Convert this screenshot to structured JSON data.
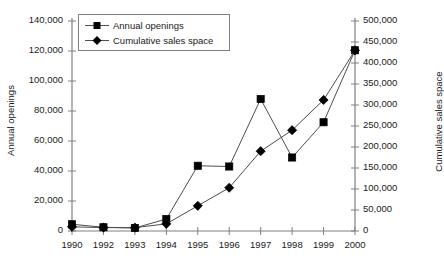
{
  "chart_data": {
    "type": "line",
    "title": "",
    "xlabel": "",
    "grid": false,
    "legend_position": "top-left",
    "categories": [
      "1990",
      "1992",
      "1993",
      "1994",
      "1995",
      "1996",
      "1997",
      "1998",
      "1999",
      "2000"
    ],
    "axes": {
      "left": {
        "label": "Annual openings",
        "ylim": [
          0,
          140000
        ],
        "tick_step": 20000,
        "ticks": [
          "0",
          "20,000",
          "40,000",
          "60,000",
          "80,000",
          "100,000",
          "120,000",
          "140,000"
        ],
        "tick_values": [
          0,
          20000,
          40000,
          60000,
          80000,
          100000,
          120000,
          140000
        ]
      },
      "right": {
        "label": "Cumulative sales space",
        "ylim": [
          0,
          500000
        ],
        "tick_step": 50000,
        "ticks": [
          "0",
          "50,000",
          "100,000",
          "150,000",
          "200,000",
          "250,000",
          "300,000",
          "350,000",
          "400,000",
          "450,000",
          "500,000"
        ],
        "tick_values": [
          0,
          50000,
          100000,
          150000,
          200000,
          250000,
          300000,
          350000,
          400000,
          450000,
          500000
        ]
      }
    },
    "series": [
      {
        "name": "Annual openings",
        "axis": "left",
        "marker": "square",
        "color": "#000000",
        "values": [
          4500,
          2500,
          2000,
          8000,
          43500,
          43000,
          88000,
          49000,
          72500,
          120500
        ]
      },
      {
        "name": "Cumulative sales space",
        "axis": "right",
        "marker": "diamond",
        "color": "#000000",
        "values": [
          10000,
          8000,
          8000,
          17000,
          60000,
          103000,
          190000,
          240000,
          312000,
          430000
        ]
      }
    ]
  },
  "legend": {
    "items": [
      {
        "label": "Annual openings",
        "marker": "square"
      },
      {
        "label": "Cumulative sales space",
        "marker": "diamond"
      }
    ]
  }
}
